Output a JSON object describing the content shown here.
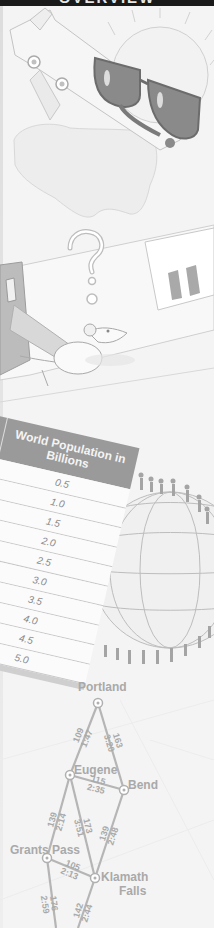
{
  "header": {
    "title": "OVERVIEW"
  },
  "illustrations": {
    "top": "airplane-with-sunglasses-and-sun",
    "middle": "mouse-in-room-with-question-mark",
    "bottom_right": "globe-with-people"
  },
  "population_table": {
    "headers": {
      "year": "Year",
      "population": "World Population in Billions"
    },
    "rows": [
      {
        "year": "30",
        "population": "0.5"
      },
      {
        "year": "0",
        "population": "1.0"
      },
      {
        "year": "",
        "population": "1.5"
      },
      {
        "year": "",
        "population": "2.0"
      },
      {
        "year": "",
        "population": "2.5"
      },
      {
        "year": "",
        "population": "3.0"
      },
      {
        "year": "",
        "population": "3.5"
      },
      {
        "year": "",
        "population": "4.0"
      },
      {
        "year": "",
        "population": "4.5"
      },
      {
        "year": "",
        "population": "5.0"
      }
    ]
  },
  "route_map": {
    "cities": [
      "Portland",
      "Eugene",
      "Bend",
      "Grants Pass",
      "Klamath Falls"
    ],
    "city_labels": {
      "portland": "Portland",
      "eugene": "Eugene",
      "bend": "Bend",
      "grants_pass": "Grants Pass",
      "klamath_falls_1": "Klamath",
      "klamath_falls_2": "Falls"
    },
    "routes": [
      {
        "from": "Portland",
        "to": "Eugene",
        "miles": "109",
        "time": "1:47"
      },
      {
        "from": "Portland",
        "to": "Bend",
        "miles": "163",
        "time": "3:20"
      },
      {
        "from": "Eugene",
        "to": "Bend",
        "miles": "115",
        "time": "2:35"
      },
      {
        "from": "Eugene",
        "to": "Grants Pass",
        "miles": "139",
        "time": "2:14"
      },
      {
        "from": "Eugene",
        "to": "Klamath Falls",
        "miles": "173",
        "time": "3:51"
      },
      {
        "from": "Bend",
        "to": "Klamath Falls",
        "miles": "139",
        "time": "2:48"
      },
      {
        "from": "Grants Pass",
        "to": "Klamath Falls",
        "miles": "105",
        "time": "2:13"
      },
      {
        "from": "Grants Pass",
        "to": "south",
        "miles": "176",
        "time": "2:59"
      },
      {
        "from": "Klamath Falls",
        "to": "south",
        "miles": "142",
        "time": "2:44"
      }
    ]
  },
  "colors": {
    "header_band": "#1a1a1a",
    "line_gray": "#b5b5b5",
    "table_header": "#9a9a9a",
    "text_gray": "#a9a9a9"
  }
}
